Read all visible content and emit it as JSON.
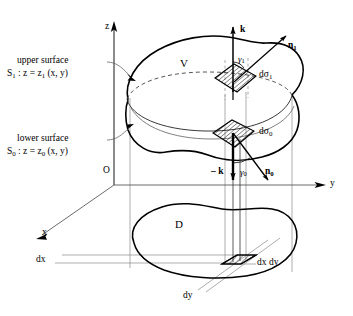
{
  "figure": {
    "axes": {
      "z_label": "z",
      "y_label": "y",
      "x_label": "x",
      "origin_label": "O"
    },
    "volume_label": "V",
    "projection_label": "D",
    "upper_surface": {
      "caption": "upper surface",
      "equation_symbol": "S",
      "equation_sub": "1",
      "equation_rest": " : z = z",
      "equation_sub2": "1",
      "equation_tail": " (x, y)"
    },
    "lower_surface": {
      "caption": "lower surface",
      "equation_symbol": "S",
      "equation_sub": "0",
      "equation_rest": " : z = z",
      "equation_sub2": "0",
      "equation_tail": " (x, y)"
    },
    "vectors": {
      "k_up": "k",
      "k_down": "– k",
      "n_upper": "n",
      "n_upper_sub": "1",
      "n_lower": "n",
      "n_lower_sub": "0"
    },
    "angles": {
      "gamma_upper": "γ",
      "gamma_upper_sub": "1",
      "gamma_lower": "γ",
      "gamma_lower_sub": "0"
    },
    "area_elements": {
      "upper": "dσ",
      "upper_sub": "1",
      "lower": "dσ",
      "lower_sub": "0",
      "base": "dx dy",
      "dx": "dx",
      "dy": "dy"
    },
    "colors": {
      "ink": "#000000",
      "guide": "#808080",
      "hatch": "#000000",
      "background": "#ffffff"
    }
  }
}
